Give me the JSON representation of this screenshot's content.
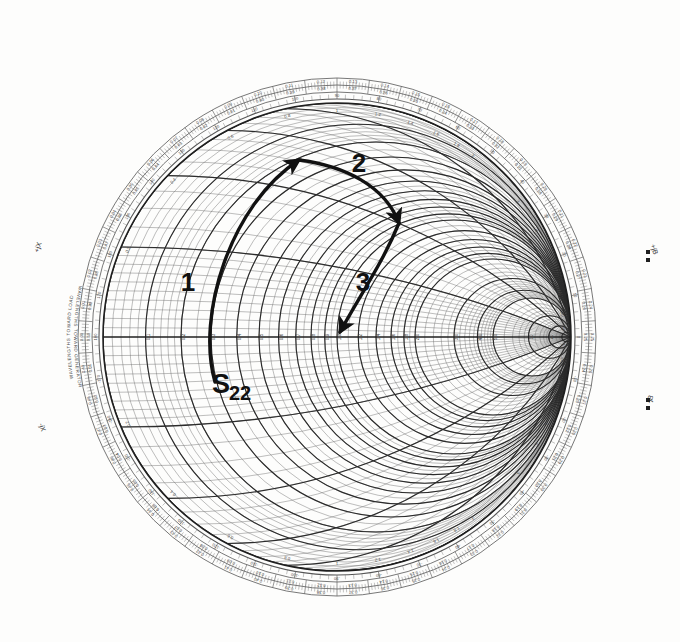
{
  "figure": {
    "kind": "smith-chart",
    "background_color": "#fbfbfa",
    "ink_color": "#3a3a3a",
    "annotation_color": "#111111"
  },
  "chart_data": {
    "type": "scatter",
    "xlabel": "",
    "ylabel": "",
    "grid": true,
    "legend_position": "none",
    "chart_type_detail": "normalized impedance (Smith) chart, unit circle, resistance and reactance grid",
    "center": {
      "x": 337,
      "y": 337
    },
    "radius": 234,
    "real_axis_labels": [
      "0.1",
      "0.2",
      "0.3",
      "0.4",
      "0.5",
      "0.6",
      "0.7",
      "0.8",
      "0.9",
      "1.0",
      "1.2",
      "1.4",
      "1.6",
      "1.8",
      "2.0",
      "3.0",
      "4.0",
      "5.0",
      "10",
      "20",
      "50"
    ],
    "reactance_labels": [
      "0.2",
      "0.4",
      "0.6",
      "0.8",
      "1.0",
      "1.2",
      "1.4",
      "1.6",
      "1.8",
      "2.0",
      "3.0",
      "4.0",
      "5.0",
      "10",
      "20",
      "50"
    ],
    "outer_scale_toward_generator": [
      "0.00",
      "0.01",
      "0.02",
      "0.03",
      "0.04",
      "0.05",
      "0.06",
      "0.07",
      "0.08",
      "0.09",
      "0.10",
      "0.11",
      "0.12",
      "0.13",
      "0.14",
      "0.15",
      "0.16",
      "0.17",
      "0.18",
      "0.19",
      "0.20",
      "0.21",
      "0.22",
      "0.23",
      "0.24",
      "0.25",
      "0.26",
      "0.27",
      "0.28",
      "0.29",
      "0.30",
      "0.31",
      "0.32",
      "0.33",
      "0.34",
      "0.35",
      "0.36",
      "0.37",
      "0.38",
      "0.39",
      "0.40",
      "0.41",
      "0.42",
      "0.43",
      "0.44",
      "0.45",
      "0.46",
      "0.47",
      "0.48",
      "0.49"
    ],
    "outer_scale_toward_load": [
      "0.50",
      "0.49",
      "0.48",
      "0.47",
      "0.46",
      "0.45",
      "0.44",
      "0.43",
      "0.42",
      "0.41",
      "0.40",
      "0.39",
      "0.38",
      "0.37",
      "0.36",
      "0.35",
      "0.34",
      "0.33",
      "0.32",
      "0.31",
      "0.30",
      "0.29",
      "0.28",
      "0.27",
      "0.26",
      "0.25",
      "0.24",
      "0.23",
      "0.22",
      "0.21",
      "0.20",
      "0.19",
      "0.18",
      "0.17",
      "0.16",
      "0.15",
      "0.14",
      "0.13",
      "0.12",
      "0.11",
      "0.10",
      "0.09",
      "0.08",
      "0.07",
      "0.06",
      "0.05",
      "0.04",
      "0.03",
      "0.02",
      "0.01"
    ],
    "angle_scale_degrees": [
      "0",
      "10",
      "20",
      "30",
      "40",
      "50",
      "60",
      "70",
      "80",
      "90",
      "100",
      "110",
      "120",
      "130",
      "140",
      "150",
      "160",
      "170",
      "180",
      "-170",
      "-160",
      "-150",
      "-140",
      "-130",
      "-120",
      "-110",
      "-100",
      "-90",
      "-80",
      "-70",
      "-60",
      "-50",
      "-40",
      "-30",
      "-20",
      "-10"
    ],
    "ring_labels": {
      "outer_ring_text": "WAVELENGTHS TOWARD GENERATOR",
      "second_ring_text": "WAVELENGTHS TOWARD LOAD",
      "angle_ring_text": "ANGLE OF REFLECTION COEFFICIENT IN DEGREES",
      "left_axis_top": "+jX",
      "left_axis_bottom": "-jX",
      "right_axis_top": "+jB",
      "right_axis_bottom": "-jB"
    },
    "annotations": [
      {
        "label": "S22",
        "type": "start-point-label",
        "x": 212,
        "y": 393,
        "note": "starting reflection coefficient S22"
      },
      {
        "label": "1",
        "type": "segment-label",
        "x": 188,
        "y": 291,
        "note": "first arc: series / constant-resistance move"
      },
      {
        "label": "2",
        "type": "segment-label",
        "x": 359,
        "y": 172,
        "note": "second arc: constant-VSWR / line move"
      },
      {
        "label": "3",
        "type": "segment-label",
        "x": 363,
        "y": 291,
        "note": "third arc: final move toward chart center"
      }
    ],
    "trajectory": [
      {
        "segment": 1,
        "from": {
          "x": 215,
          "y": 382
        },
        "to": {
          "x": 299,
          "y": 160
        },
        "arrow": "end",
        "shape": "arc"
      },
      {
        "segment": 2,
        "from": {
          "x": 299,
          "y": 160
        },
        "to": {
          "x": 399,
          "y": 223
        },
        "arrow": "end",
        "shape": "arc"
      },
      {
        "segment": 3,
        "from": {
          "x": 399,
          "y": 223
        },
        "to": {
          "x": 340,
          "y": 332
        },
        "arrow": "end",
        "shape": "arc"
      }
    ]
  }
}
